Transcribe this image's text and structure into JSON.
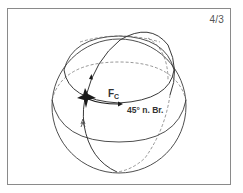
{
  "figure": {
    "number": "4/3",
    "force_label_main": "F",
    "force_label_sub": "C",
    "latitude_label": "45° n. Br."
  },
  "colors": {
    "line": "#3a3a3a",
    "dashed": "#6a6a6a",
    "frame": "#8a8a8a",
    "marker": "#1a1a1a"
  }
}
